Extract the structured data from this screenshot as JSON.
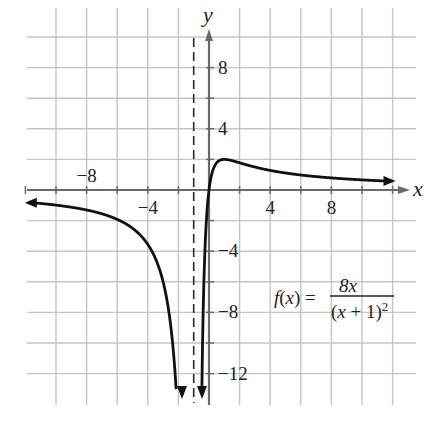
{
  "chart_data": {
    "type": "line",
    "title": "",
    "function_label": {
      "lhs": "f(x) =",
      "numerator": "8x",
      "denominator": "(x + 1)",
      "denominator_exponent": "2"
    },
    "xlabel": "x",
    "ylabel": "y",
    "xlim": [
      -12,
      13
    ],
    "ylim": [
      -14,
      10
    ],
    "grid": true,
    "grid_spacing": 2,
    "x_tick_labels": [
      {
        "value": -8,
        "label": "−8"
      },
      {
        "value": -4,
        "label": "−4"
      },
      {
        "value": 4,
        "label": "4"
      },
      {
        "value": 8,
        "label": "8"
      }
    ],
    "y_tick_labels": [
      {
        "value": 8,
        "label": "8"
      },
      {
        "value": 4,
        "label": "4"
      },
      {
        "value": -4,
        "label": "−4"
      },
      {
        "value": -8,
        "label": "−8"
      },
      {
        "value": -12,
        "label": "−12"
      }
    ],
    "vertical_asymptote": {
      "x": -1,
      "style": "dashed"
    },
    "horizontal_asymptote": {
      "y": 0
    },
    "series": [
      {
        "name": "f(x) = 8x/(x+1)^2, left branch",
        "x": [
          -12,
          -10,
          -8,
          -6,
          -5,
          -4,
          -3,
          -2.5,
          -2,
          -1.8,
          -1.6,
          -1.5
        ],
        "y": [
          -0.79,
          -0.99,
          -1.31,
          -1.92,
          -2.5,
          -3.56,
          -6.0,
          -8.89,
          -16.0,
          -22.5,
          -35.6,
          -48.0
        ]
      },
      {
        "name": "f(x) = 8x/(x+1)^2, right branch",
        "x": [
          -0.6,
          -0.4,
          -0.2,
          0,
          0.5,
          1,
          2,
          3,
          4,
          6,
          8,
          10,
          11.5
        ],
        "y": [
          -30.0,
          -8.89,
          -2.5,
          0,
          1.78,
          2.0,
          1.78,
          1.5,
          1.28,
          0.98,
          0.79,
          0.66,
          0.59
        ]
      }
    ],
    "key_points": {
      "local_max": {
        "x": 1,
        "y": 2
      },
      "x_intercept": {
        "x": 0,
        "y": 0
      }
    }
  }
}
